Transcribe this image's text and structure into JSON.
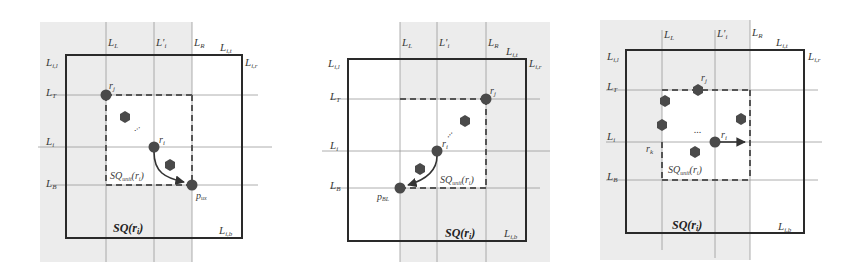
{
  "colors": {
    "background": "#ffffff",
    "shaded_region": "#ececec",
    "square_border": "#2a2a2a",
    "grid_line": "#9a9a9a",
    "dashed_box": "#555555",
    "robot": "#4a4a4a",
    "arrow": "#333333"
  },
  "panels": [
    {
      "id": "panel-1",
      "labels": {
        "L_L": "L",
        "L_L_sub": "L",
        "L_prime_i": "L'",
        "L_prime_i_sub": "i",
        "L_R": "L",
        "L_R_sub": "R",
        "L_it": "L",
        "L_it_sub": "i,t",
        "L_il": "L",
        "L_il_sub": "i,l",
        "L_ir": "L",
        "L_ir_sub": "i,r",
        "L_T": "L",
        "L_T_sub": "T",
        "L_i": "L",
        "L_i_sub": "i",
        "L_B": "L",
        "L_B_sub": "B",
        "L_ib": "L",
        "L_ib_sub": "i,b",
        "r_j": "r",
        "r_j_sub": "j",
        "r_i": "r",
        "r_i_sub": "i",
        "target": "p",
        "target_sub": "ux",
        "sq_unit": "SQ",
        "sq_unit_sub": "unit",
        "sq_unit_arg": "(r",
        "sq_unit_arg_sub": "i",
        "sq_unit_close": ")",
        "sq": "SQ(r",
        "sq_sub": "i",
        "sq_close": ")",
        "ellipsis": "⋮"
      }
    },
    {
      "id": "panel-2",
      "labels": {
        "L_L": "L",
        "L_L_sub": "L",
        "L_prime_i": "L'",
        "L_prime_i_sub": "i",
        "L_R": "L",
        "L_R_sub": "R",
        "L_it": "L",
        "L_it_sub": "i,t",
        "L_il": "L",
        "L_il_sub": "i,l",
        "L_ir": "L",
        "L_ir_sub": "i,r",
        "L_T": "L",
        "L_T_sub": "T",
        "L_i": "L",
        "L_i_sub": "i",
        "L_B": "L",
        "L_B_sub": "B",
        "L_ib": "L",
        "L_ib_sub": "i,b",
        "r_j": "r",
        "r_j_sub": "j",
        "r_i": "r",
        "r_i_sub": "i",
        "target": "p",
        "target_sub": "BL",
        "sq_unit": "SQ",
        "sq_unit_sub": "unit",
        "sq_unit_arg": "(r",
        "sq_unit_arg_sub": "i",
        "sq_unit_close": ")",
        "sq": "SQ(r",
        "sq_sub": "i",
        "sq_close": ")"
      }
    },
    {
      "id": "panel-3",
      "labels": {
        "L_L": "L",
        "L_L_sub": "L",
        "L_prime_i": "L'",
        "L_prime_i_sub": "i",
        "L_R": "L",
        "L_R_sub": "R",
        "L_it": "L",
        "L_it_sub": "i,t",
        "L_il": "L",
        "L_il_sub": "i,l",
        "L_ir": "L",
        "L_ir_sub": "i,r",
        "L_T": "L",
        "L_T_sub": "T",
        "L_i": "L",
        "L_i_sub": "i",
        "L_B": "L",
        "L_B_sub": "B",
        "L_ib": "L",
        "L_ib_sub": "i,b",
        "r_j": "r",
        "r_j_sub": "j",
        "r_i": "r",
        "r_i_sub": "i",
        "r_k": "r",
        "r_k_sub": "k",
        "sq_unit": "SQ",
        "sq_unit_sub": "unit",
        "sq_unit_arg": "(r",
        "sq_unit_arg_sub": "i",
        "sq_unit_close": ")",
        "sq": "SQ(r",
        "sq_sub": "i",
        "sq_close": ")",
        "ellipsis": "..."
      }
    }
  ]
}
